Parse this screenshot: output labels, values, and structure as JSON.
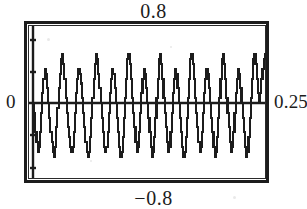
{
  "figure": {
    "name": "quantized-oscillation-plot",
    "background_color": "#ffffff",
    "ink_color": "#1c1c1c"
  },
  "labels": {
    "top": "0.8",
    "bottom": "−0.8",
    "left": "0",
    "right": "0.25"
  },
  "chart_data": {
    "type": "line",
    "title": "",
    "subtitle": "",
    "xlabel": "",
    "ylabel": "",
    "legend": [],
    "grid": false,
    "legend_position": "none",
    "axis_style": "boxed-frame-with-zero-line",
    "tick_labels": {
      "y_top": "0.8",
      "y_bottom": "-0.8",
      "y_zero": "0",
      "x_max": "0.25"
    },
    "xlim": [
      0,
      0.25
    ],
    "ylim": [
      -0.8,
      0.8
    ],
    "y_ticks": [
      0.8,
      0.4,
      0,
      -0.4,
      -0.8
    ],
    "x_ticks": [
      0,
      0.25
    ],
    "quantized": true,
    "quantization_levels": 17,
    "cycles_visible": 8,
    "series": [
      {
        "name": "quantized-signal",
        "color": "#1c1c1c",
        "linewidth": 2,
        "x": [
          0.0,
          0.0012,
          0.0025,
          0.0037,
          0.005,
          0.0062,
          0.0075,
          0.0087,
          0.01,
          0.0112,
          0.0125,
          0.0137,
          0.015,
          0.0162,
          0.0175,
          0.0187,
          0.02,
          0.0212,
          0.0225,
          0.0237,
          0.025,
          0.0262,
          0.0275,
          0.0287,
          0.03,
          0.0312,
          0.0325,
          0.0337,
          0.035,
          0.0362,
          0.0375,
          0.0387,
          0.04,
          0.0412,
          0.0425,
          0.0437,
          0.045,
          0.0462,
          0.0475,
          0.0487,
          0.05,
          0.0512,
          0.0525,
          0.0537,
          0.055,
          0.0562,
          0.0575,
          0.0587,
          0.06,
          0.0612,
          0.0625,
          0.0637,
          0.065,
          0.0662,
          0.0675,
          0.0687,
          0.07,
          0.0712,
          0.0725,
          0.0737,
          0.075,
          0.0762,
          0.0775,
          0.0787,
          0.08,
          0.0812,
          0.0825,
          0.0837,
          0.085,
          0.0862,
          0.0875,
          0.0887,
          0.09,
          0.0912,
          0.0925,
          0.0937,
          0.095,
          0.0962,
          0.0975,
          0.0987,
          0.1,
          0.1012,
          0.1025,
          0.1037,
          0.105,
          0.1062,
          0.1075,
          0.1087,
          0.11,
          0.1112,
          0.1125,
          0.1137,
          0.115,
          0.1162,
          0.1175,
          0.1187,
          0.12,
          0.1212,
          0.1225,
          0.1237,
          0.125,
          0.1262,
          0.1275,
          0.1287,
          0.13,
          0.1312,
          0.1325,
          0.1337,
          0.135,
          0.1362,
          0.1375,
          0.1387,
          0.14,
          0.1412,
          0.1425,
          0.1437,
          0.145,
          0.1462,
          0.1475,
          0.1487,
          0.15,
          0.1512,
          0.1525,
          0.1537,
          0.155,
          0.1562,
          0.1575,
          0.1587,
          0.16,
          0.1612,
          0.1625,
          0.1637,
          0.165,
          0.1662,
          0.1675,
          0.1687,
          0.17,
          0.1712,
          0.1725,
          0.1737,
          0.175,
          0.1762,
          0.1775,
          0.1787,
          0.18,
          0.1812,
          0.1825,
          0.1837,
          0.185,
          0.1862,
          0.1875,
          0.1887,
          0.19,
          0.1912,
          0.1925,
          0.1937,
          0.195,
          0.1962,
          0.1975,
          0.1987,
          0.2,
          0.2012,
          0.2025,
          0.2037,
          0.205,
          0.2062,
          0.2075,
          0.2087,
          0.21,
          0.2112,
          0.2125,
          0.2137,
          0.215,
          0.2162,
          0.2175,
          0.2187,
          0.22,
          0.2212,
          0.2225,
          0.2237,
          0.225,
          0.2262,
          0.2275,
          0.2287,
          0.23,
          0.2312,
          0.2325,
          0.2337,
          0.235,
          0.2362,
          0.2375,
          0.2387,
          0.24,
          0.2412,
          0.2425,
          0.2437,
          0.245,
          0.2462,
          0.2475,
          0.2487,
          0.25
        ],
        "y": [
          0.0,
          -0.1,
          -0.3,
          -0.4,
          -0.5,
          -0.45,
          -0.3,
          -0.1,
          0.1,
          0.25,
          0.35,
          0.3,
          0.15,
          0.0,
          -0.15,
          -0.3,
          -0.4,
          -0.5,
          -0.55,
          -0.45,
          -0.25,
          -0.05,
          0.15,
          0.3,
          0.45,
          0.5,
          0.4,
          0.25,
          0.05,
          -0.1,
          -0.25,
          -0.35,
          -0.45,
          -0.5,
          -0.45,
          -0.3,
          -0.1,
          0.1,
          0.25,
          0.35,
          0.3,
          0.2,
          0.05,
          -0.1,
          -0.25,
          -0.4,
          -0.5,
          -0.55,
          -0.5,
          -0.35,
          -0.15,
          0.05,
          0.25,
          0.4,
          0.5,
          0.45,
          0.3,
          0.15,
          0.0,
          -0.15,
          -0.3,
          -0.45,
          -0.5,
          -0.45,
          -0.3,
          -0.1,
          0.1,
          0.25,
          0.35,
          0.3,
          0.15,
          0.0,
          -0.15,
          -0.3,
          -0.45,
          -0.55,
          -0.5,
          -0.35,
          -0.15,
          0.05,
          0.25,
          0.45,
          0.5,
          0.4,
          0.25,
          0.05,
          -0.1,
          -0.25,
          -0.4,
          -0.5,
          -0.45,
          -0.3,
          -0.1,
          0.1,
          0.25,
          0.35,
          0.3,
          0.15,
          0.0,
          -0.15,
          -0.3,
          -0.45,
          -0.55,
          -0.5,
          -0.35,
          -0.15,
          0.05,
          0.25,
          0.45,
          0.5,
          0.4,
          0.25,
          0.05,
          -0.1,
          -0.25,
          -0.4,
          -0.5,
          -0.45,
          -0.3,
          -0.1,
          0.1,
          0.25,
          0.35,
          0.3,
          0.15,
          0.0,
          -0.15,
          -0.3,
          -0.45,
          -0.55,
          -0.5,
          -0.35,
          -0.15,
          0.05,
          0.25,
          0.45,
          0.5,
          0.4,
          0.25,
          0.05,
          -0.1,
          -0.25,
          -0.4,
          -0.5,
          -0.45,
          -0.3,
          -0.1,
          0.1,
          0.25,
          0.35,
          0.3,
          0.15,
          0.0,
          -0.15,
          -0.3,
          -0.45,
          -0.55,
          -0.5,
          -0.35,
          -0.15,
          0.05,
          0.25,
          0.45,
          0.5,
          0.4,
          0.25,
          0.05,
          -0.1,
          -0.25,
          -0.4,
          -0.5,
          -0.45,
          -0.3,
          -0.1,
          0.1,
          0.25,
          0.35,
          0.3,
          0.15,
          0.0,
          -0.15,
          -0.3,
          -0.45,
          -0.55,
          -0.5,
          -0.35,
          -0.15,
          0.05,
          0.25,
          0.45,
          0.5,
          0.4,
          0.25,
          0.1,
          0.0,
          0.1,
          0.25,
          0.35,
          0.45,
          0.5,
          0.45
        ]
      }
    ]
  },
  "geometry": {
    "frame": {
      "x": 25,
      "y": 22,
      "width": 243,
      "height": 160
    },
    "zero_line_y": 103,
    "left_axis_x": 33,
    "tick_marks_y": [
      40,
      72,
      103,
      135,
      168
    ]
  }
}
